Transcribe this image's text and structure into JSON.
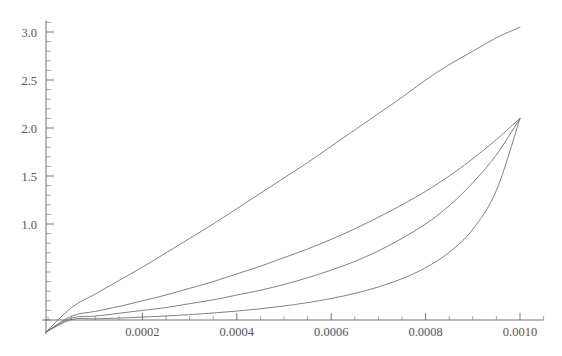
{
  "figure": {
    "title": "",
    "background": "#ffffff",
    "width": 562,
    "height": 356
  },
  "axes": {
    "x_label": "",
    "y_label": "",
    "x_ticks": [
      "0.0002",
      "0.0004",
      "0.0006",
      "0.0008",
      "0.0010"
    ],
    "y_ticks": [
      "1.0",
      "1.5",
      "2.0",
      "2.5",
      "3.0"
    ]
  },
  "chart_data": {
    "type": "line",
    "title": "",
    "xlabel": "",
    "ylabel": "",
    "xlim": [
      0,
      0.00105
    ],
    "ylim": [
      0,
      3.12
    ],
    "grid": false,
    "legend": null,
    "x_tick_values": [
      0.0002,
      0.0004,
      0.0006,
      0.0008,
      0.001
    ],
    "x_tick_labels": [
      "0.0002",
      "0.0004",
      "0.0006",
      "0.0008",
      "0.0010"
    ],
    "y_tick_values": [
      1.0,
      1.5,
      2.0,
      2.5,
      3.0
    ],
    "y_tick_labels": [
      "1.0",
      "1.5",
      "2.0",
      "2.5",
      "3.0"
    ],
    "x_minor_tick_step": 5e-05,
    "y_minor_tick_step": 0.1,
    "line_color": "#6b6b70",
    "line_width": 0.85,
    "x": [
      0.0,
      5e-05,
      0.0001,
      0.00015,
      0.0002,
      0.00025,
      0.0003,
      0.00035,
      0.0004,
      0.00045,
      0.0005,
      0.00055,
      0.0006,
      0.00065,
      0.0007,
      0.00075,
      0.0008,
      0.00085,
      0.0009,
      0.00095,
      0.001
    ],
    "series": [
      {
        "name": "curve-1",
        "description": "uppermost, near-linear slightly convex curve rising to about 3.05",
        "values": [
          0.0,
          0.13,
          0.27,
          0.41,
          0.55,
          0.7,
          0.85,
          1.0,
          1.16,
          1.32,
          1.48,
          1.64,
          1.81,
          1.98,
          2.15,
          2.32,
          2.5,
          2.66,
          2.8,
          2.94,
          3.05
        ]
      },
      {
        "name": "curve-2",
        "description": "second curve, moderate convexity, ends at about 2.10",
        "values": [
          0.0,
          0.04,
          0.09,
          0.14,
          0.2,
          0.26,
          0.33,
          0.4,
          0.48,
          0.56,
          0.65,
          0.74,
          0.84,
          0.95,
          1.07,
          1.2,
          1.34,
          1.5,
          1.68,
          1.88,
          2.1
        ]
      },
      {
        "name": "curve-3",
        "description": "third curve, stronger convexity, ends at about 2.10",
        "values": [
          0.0,
          0.02,
          0.04,
          0.07,
          0.1,
          0.13,
          0.17,
          0.21,
          0.26,
          0.31,
          0.37,
          0.44,
          0.52,
          0.61,
          0.72,
          0.85,
          1.0,
          1.19,
          1.43,
          1.72,
          2.1
        ]
      },
      {
        "name": "curve-4",
        "description": "lowest curve, most convex, hugs the axis then rises sharply to about 2.10",
        "values": [
          0.0,
          0.005,
          0.012,
          0.02,
          0.03,
          0.042,
          0.056,
          0.073,
          0.093,
          0.117,
          0.146,
          0.181,
          0.224,
          0.277,
          0.344,
          0.43,
          0.545,
          0.705,
          0.945,
          1.35,
          2.1
        ]
      }
    ]
  }
}
